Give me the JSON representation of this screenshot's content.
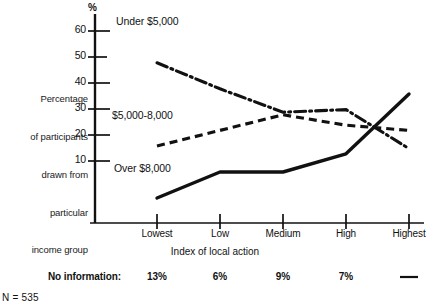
{
  "chart_data": {
    "type": "line",
    "title": "",
    "xlabel": "Index of local action",
    "ylabel": "Percentage of participants drawn from particular income group",
    "y_unit": "%",
    "ylim": [
      0,
      65
    ],
    "yticks": [
      10,
      20,
      30,
      40,
      50,
      60
    ],
    "grid": false,
    "legend_position": "inline-labels",
    "categories": [
      "Lowest",
      "Low",
      "Medium",
      "High",
      "Highest"
    ],
    "series": [
      {
        "name": "Under $5,000",
        "style": "dash-dot",
        "values": [
          57,
          47,
          38,
          39,
          24
        ]
      },
      {
        "name": "$5,000-8,000",
        "style": "dashed",
        "values": [
          25,
          31,
          37,
          33,
          31
        ]
      },
      {
        "name": "Over $8,000",
        "style": "solid",
        "values": [
          5,
          15,
          15,
          22,
          45
        ]
      }
    ],
    "annotations": {
      "no_information_label": "No information:",
      "no_information_values": [
        "13%",
        "6%",
        "9%",
        "7%",
        "—"
      ],
      "sample_size": "N = 535"
    }
  },
  "axis": {
    "percent_symbol": "%",
    "y_caption_lines": [
      "Percentage",
      "of participants",
      "drawn from",
      "particular",
      "income group"
    ]
  },
  "colors": {
    "ink": "#111111",
    "background": "#ffffff"
  }
}
